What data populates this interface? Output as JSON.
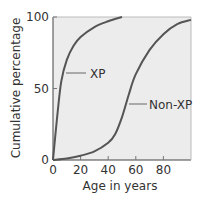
{
  "chart_data": {
    "type": "line",
    "title": "",
    "xlabel": "Age in years",
    "ylabel": "Cumulative percentage",
    "xlim": [
      0,
      100
    ],
    "ylim": [
      0,
      100
    ],
    "x_ticks": [
      "0",
      "20",
      "40",
      "60",
      "80"
    ],
    "y_ticks": [
      "0",
      "50",
      "100"
    ],
    "grid": false,
    "background": "#ececec",
    "line_color": "#555555",
    "series": [
      {
        "name": "XP",
        "x": [
          0,
          3,
          6,
          10,
          15,
          20,
          30,
          40,
          50
        ],
        "y": [
          0,
          30,
          55,
          70,
          80,
          86,
          93,
          97,
          100
        ]
      },
      {
        "name": "Non-XP",
        "x": [
          0,
          10,
          20,
          30,
          40,
          45,
          50,
          55,
          60,
          70,
          80,
          90,
          100
        ],
        "y": [
          0,
          1,
          3,
          6,
          12,
          18,
          30,
          46,
          60,
          77,
          88,
          95,
          98
        ]
      }
    ],
    "annotations": [
      {
        "text": "XP",
        "x": 10,
        "y": 60
      },
      {
        "text": "Non-XP",
        "x": 52,
        "y": 40
      }
    ]
  }
}
